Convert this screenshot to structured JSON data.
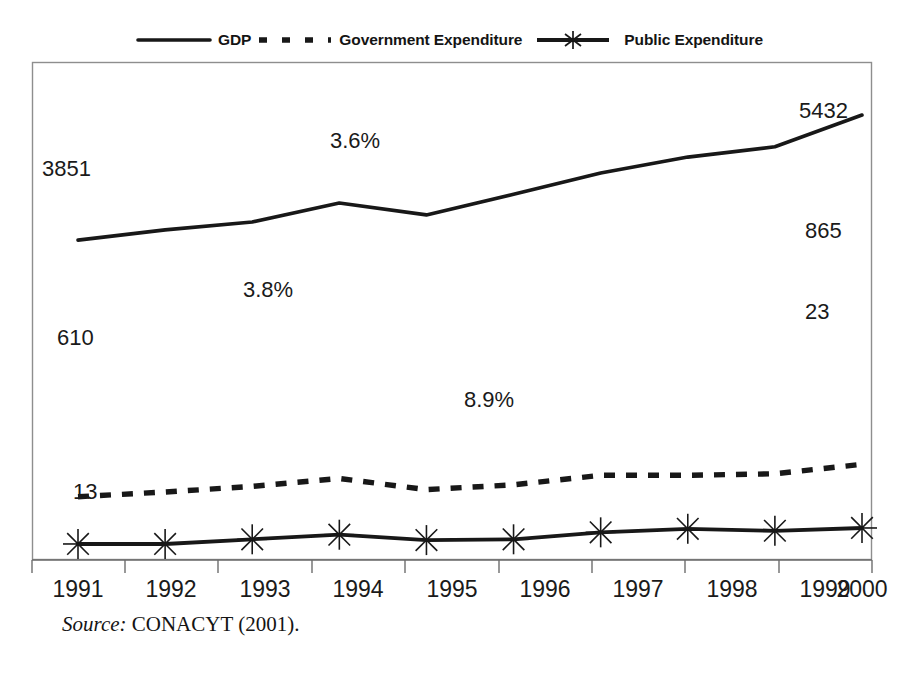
{
  "legend": {
    "items": [
      {
        "label": "GDP",
        "style": "solid",
        "marker": "none"
      },
      {
        "label": "Government Expenditure",
        "style": "dashed",
        "marker": "none"
      },
      {
        "label": "Public Expenditure",
        "style": "solid",
        "marker": "star"
      }
    ]
  },
  "source": {
    "prefix": "Source:",
    "text": "CONACYT (2001)."
  },
  "colors": {
    "ink": "#181818",
    "frame": "#8e8e8e",
    "axis": "#6d6d6d",
    "background": "#ffffff"
  },
  "annotations": [
    {
      "text": "3851",
      "series": "GDP",
      "x": 1991,
      "placement": "above-left"
    },
    {
      "text": "3.6%",
      "series": "GDP",
      "x": 1994,
      "placement": "above"
    },
    {
      "text": "5432",
      "series": "GDP",
      "x": 2000,
      "placement": "below-left"
    },
    {
      "text": "610",
      "series": "Government Expenditure",
      "x": 1991,
      "placement": "below"
    },
    {
      "text": "3.8%",
      "series": "Government Expenditure",
      "x": 1993,
      "placement": "below-right"
    },
    {
      "text": "865",
      "series": "Government Expenditure",
      "x": 2000,
      "placement": "below-left"
    },
    {
      "text": "13",
      "series": "Public Expenditure",
      "x": 1991,
      "placement": "above-right"
    },
    {
      "text": "8.9%",
      "series": "Public Expenditure",
      "x": 1996,
      "placement": "above-left"
    },
    {
      "text": "23",
      "series": "Public Expenditure",
      "x": 2000,
      "placement": "below-left"
    }
  ],
  "chart_data": {
    "type": "line",
    "title": "",
    "subtitle": "",
    "xlabel": "",
    "ylabel": "",
    "grid": false,
    "legend_position": "top-center",
    "axis_y_visible": false,
    "categories": [
      1991,
      1992,
      1993,
      1994,
      1995,
      1996,
      1997,
      1998,
      1999,
      2000
    ],
    "tick_labels": [
      "1991",
      "1992",
      "1993",
      "1994",
      "1995",
      "1996",
      "1997",
      "1998",
      "1999",
      "2000"
    ],
    "ylim": [
      0,
      6000
    ],
    "series": [
      {
        "name": "GDP",
        "style": "solid",
        "marker": "none",
        "values": [
          3851,
          3980,
          4080,
          4320,
          4170,
          4430,
          4700,
          4900,
          5030,
          5432
        ]
      },
      {
        "name": "Government Expenditure",
        "style": "dashed",
        "marker": "none",
        "values": [
          610,
          670,
          740,
          840,
          700,
          760,
          880,
          880,
          900,
          1020
        ]
      },
      {
        "name": "Public Expenditure",
        "style": "solid",
        "marker": "star",
        "values": [
          13,
          13,
          72,
          130,
          62,
          72,
          160,
          205,
          180,
          215
        ]
      }
    ],
    "annotation_values": {
      "GDP_first": 3851,
      "GDP_last": 5432,
      "GDP_peak_pct": "3.6%",
      "GovExp_first": 610,
      "GovExp_last": 865,
      "GovExp_pct": "3.8%",
      "PubExp_first": 13,
      "PubExp_last": 23,
      "PubExp_pct": "8.9%"
    }
  }
}
